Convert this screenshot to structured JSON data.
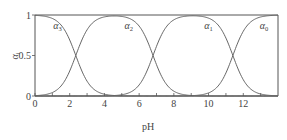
{
  "chart_data": {
    "type": "line",
    "title": "",
    "xlabel": "pH",
    "ylabel": "α",
    "ylabel_subscript": "i",
    "xlim": [
      0,
      14
    ],
    "ylim": [
      0,
      1
    ],
    "x_ticks_major": [
      0,
      2,
      4,
      6,
      8,
      10,
      12
    ],
    "x_ticks_minor_step": 1,
    "y_ticks": [
      {
        "value": 0,
        "label": "0"
      },
      {
        "value": 0.5,
        "label": "0.5"
      },
      {
        "value": 1,
        "label": "1"
      }
    ],
    "grid": false,
    "crossing_pH": [
      2.35,
      6.8,
      11.4
    ],
    "series": [
      {
        "name": "α3",
        "symbol": "α",
        "subscript": "3",
        "label_pH": 1.3,
        "label_y": 0.83
      },
      {
        "name": "α2",
        "symbol": "α",
        "subscript": "2",
        "label_pH": 5.4,
        "label_y": 0.83
      },
      {
        "name": "α1",
        "symbol": "α",
        "subscript": "1",
        "label_pH": 10.0,
        "label_y": 0.83
      },
      {
        "name": "α0",
        "symbol": "α",
        "subscript": "0",
        "label_pH": 13.2,
        "label_y": 0.83
      }
    ]
  }
}
